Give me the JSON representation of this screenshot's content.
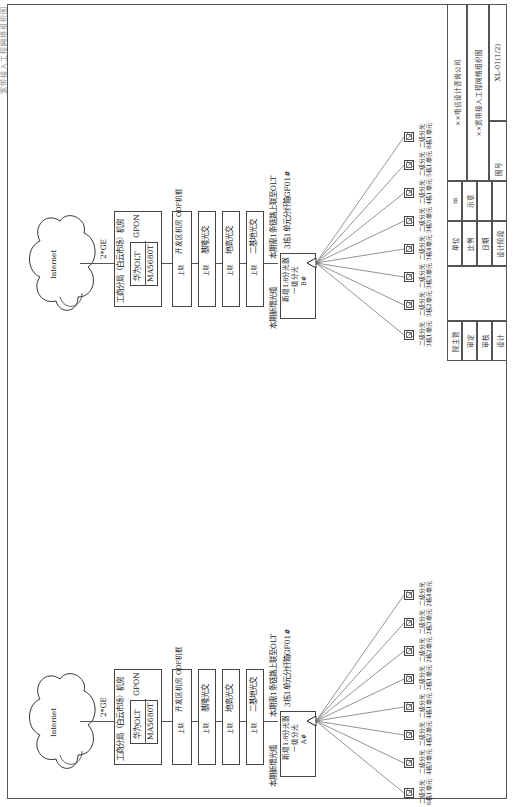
{
  "header": {
    "text": "宽带接入工程网络组织图"
  },
  "diagrams": [
    {
      "id": "left",
      "internet_label": "Internet",
      "link_label": "2*GE",
      "olt_room": {
        "title": "工商分局（白云市场）机房",
        "olt_line1": "华为OLT",
        "olt_line2": "MA5680T",
        "tech": "GPON"
      },
      "odf_boxes": [
        {
          "tag": "上联",
          "label": "开发区机房 ODF机框"
        },
        {
          "tag": "上联",
          "label": "基隆光交"
        },
        {
          "tag": "上联",
          "label": "地高光交"
        },
        {
          "tag": "上联",
          "label": "二基地光交"
        }
      ],
      "new_cable_label": "本期新增光缆",
      "uplink_note": "本期需1条链路上联至OLT",
      "splitter": {
        "line1": "新增1:8分光器",
        "line2": "一级分光",
        "line3": "A#"
      },
      "cabinet_note": "3栋1单元分纤箱GF01#",
      "onus": [
        {
          "line1": "二级分光",
          "line2": "6栋1单元"
        },
        {
          "line1": "二级分光",
          "line2": "4栋3单元"
        },
        {
          "line1": "二级分光",
          "line2": "4栋2单元"
        },
        {
          "line1": "二级分光",
          "line2": "4栋1单元"
        },
        {
          "line1": "二级分光",
          "line2": "2栋1单元"
        },
        {
          "line1": "二级分光",
          "line2": "2栋2单元"
        },
        {
          "line1": "二级分光",
          "line2": "2栋3单元"
        },
        {
          "line1": "二级分光",
          "line2": "2栋4单元"
        }
      ]
    },
    {
      "id": "right",
      "internet_label": "Internet",
      "link_label": "2*GE",
      "olt_room": {
        "title": "工商分局（白云市场）机房",
        "olt_line1": "华为OLT",
        "olt_line2": "MA5680T",
        "tech": "GPON"
      },
      "odf_boxes": [
        {
          "tag": "上联",
          "label": "开发区机房 ODF机框"
        },
        {
          "tag": "上联",
          "label": "基隆光交"
        },
        {
          "tag": "上联",
          "label": "地高光交"
        },
        {
          "tag": "上联",
          "label": "二基地光交"
        }
      ],
      "new_cable_label": "本期新增光缆",
      "uplink_note": "本期需1条链路上联至OLT",
      "splitter": {
        "line1": "新增1:8分光器",
        "line2": "一级分光",
        "line3": "B#"
      },
      "cabinet_note": "3栋1单元分纤箱GF01#",
      "onus": [
        {
          "line1": "二级分光",
          "line2": "3栋1单元"
        },
        {
          "line1": "二级分光",
          "line2": "3栋2单元"
        },
        {
          "line1": "二级分光",
          "line2": "3栋3单元"
        },
        {
          "line1": "二级分光",
          "line2": "3栋4单元"
        },
        {
          "line1": "二级分光",
          "line2": "3栋5单元"
        },
        {
          "line1": "二级分光",
          "line2": "4栋1单元"
        },
        {
          "line1": "二级分光",
          "line2": "5栋1单元"
        },
        {
          "line1": "二级分光",
          "line2": "8栋1单元"
        }
      ]
    }
  ],
  "title_block": {
    "roles": [
      "院主管",
      "审定",
      "审核",
      "设计"
    ],
    "fields": [
      {
        "label": "单位",
        "value": "m"
      },
      {
        "label": "比例",
        "value": "示意"
      },
      {
        "label": "日期",
        "value": ""
      },
      {
        "label": "设计阶段",
        "value": ""
      }
    ],
    "company": "××电信设计咨询公司",
    "drawing_title": "××宽带接入工程网络组织图",
    "drawing_no_label": "图号",
    "drawing_no": "XL-01(1/2)"
  }
}
